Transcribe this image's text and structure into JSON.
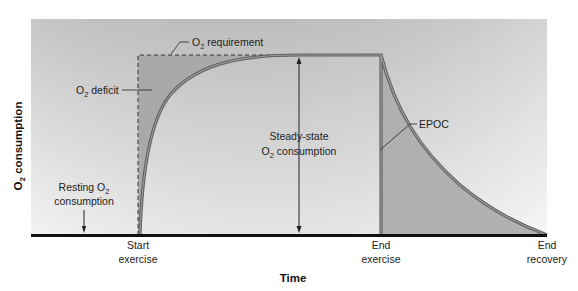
{
  "diagram": {
    "y_axis_title": "O",
    "y_axis_title_sub": "2",
    "y_axis_title_rest": " consumption",
    "x_axis_title": "Time",
    "x_markers": [
      {
        "line1": "Start",
        "line2": "exercise"
      },
      {
        "line1": "End",
        "line2": "exercise"
      },
      {
        "line1": "End",
        "line2": "recovery"
      }
    ],
    "annotations": {
      "o2_requirement": {
        "pre": "O",
        "sub": "2",
        "post": " requirement"
      },
      "o2_deficit": {
        "pre": "O",
        "sub": "2",
        "post": " deficit"
      },
      "steady_state": {
        "line1": "Steady-state",
        "line2_pre": "O",
        "line2_sub": "2",
        "line2_post": " consumption"
      },
      "epoc": {
        "text": "EPOC"
      },
      "resting": {
        "line1_pre": "Resting O",
        "line1_sub": "2",
        "line2": "consumption"
      }
    },
    "colors": {
      "background_top": "#c9c9c9",
      "background_bottom": "#f2f2f2",
      "shaded_region": "#a8a8a8",
      "curve": "#6e6e6e",
      "baseline": "#111111"
    }
  }
}
